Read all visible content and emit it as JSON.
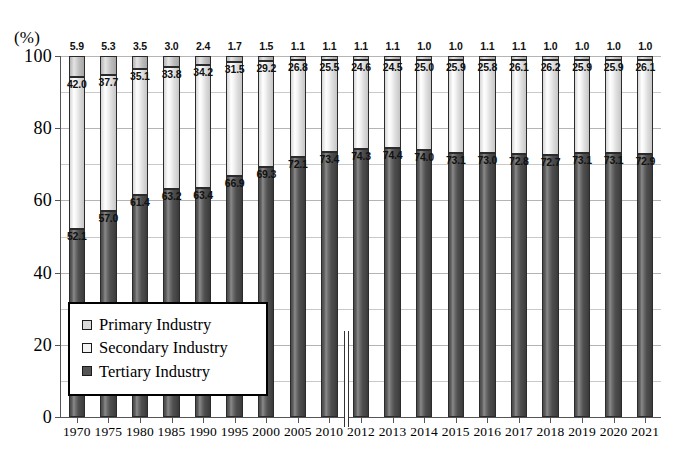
{
  "chart_data": {
    "type": "bar",
    "subtype": "stacked-percentage",
    "title": "",
    "xlabel": "",
    "ylabel": "(%)",
    "ylim": [
      0,
      100
    ],
    "yticks": [
      0,
      20,
      40,
      60,
      80,
      100
    ],
    "minor_gridlines": [
      10,
      30,
      50,
      70,
      90
    ],
    "grid": true,
    "legend_position": "inside-lower-left",
    "categories": [
      "1970",
      "1975",
      "1980",
      "1985",
      "1990",
      "1995",
      "2000",
      "2005",
      "2010",
      "2012",
      "2013",
      "2014",
      "2015",
      "2016",
      "2017",
      "2018",
      "2019",
      "2020",
      "2021"
    ],
    "series": [
      {
        "name": "Primary Industry",
        "color": "#d9d9d9",
        "values": [
          5.9,
          5.3,
          3.5,
          3.0,
          2.4,
          1.7,
          1.5,
          1.1,
          1.1,
          1.1,
          1.1,
          1.0,
          1.0,
          1.1,
          1.1,
          1.0,
          1.0,
          1.0,
          1.0
        ]
      },
      {
        "name": "Secondary Industry",
        "color": "#f2f2f2",
        "values": [
          42.0,
          37.7,
          35.1,
          33.8,
          34.2,
          31.5,
          29.2,
          26.8,
          25.5,
          24.6,
          24.5,
          25.0,
          25.9,
          25.8,
          26.1,
          26.2,
          25.9,
          25.9,
          26.1
        ]
      },
      {
        "name": "Tertiary Industry",
        "color": "#555555",
        "values": [
          52.1,
          57.0,
          61.4,
          63.2,
          63.4,
          66.9,
          69.3,
          72.1,
          73.4,
          74.3,
          74.4,
          74.0,
          73.1,
          73.0,
          72.8,
          72.7,
          73.1,
          73.1,
          72.9
        ]
      }
    ],
    "annotations": {
      "series_break": {
        "between": [
          "2010",
          "2012"
        ],
        "description": "vertical divider line between 2010 and 2012"
      }
    }
  },
  "axis": {
    "unit_label": "(%)",
    "y_tick_labels": [
      "0",
      "20",
      "40",
      "60",
      "80",
      "100"
    ]
  },
  "legend": {
    "items": [
      {
        "label": "Primary Industry",
        "swatch": "primary-swatch"
      },
      {
        "label": "Secondary Industry",
        "swatch": "secondary-swatch"
      },
      {
        "label": "Tertiary Industry",
        "swatch": "tertiary-swatch"
      }
    ]
  }
}
